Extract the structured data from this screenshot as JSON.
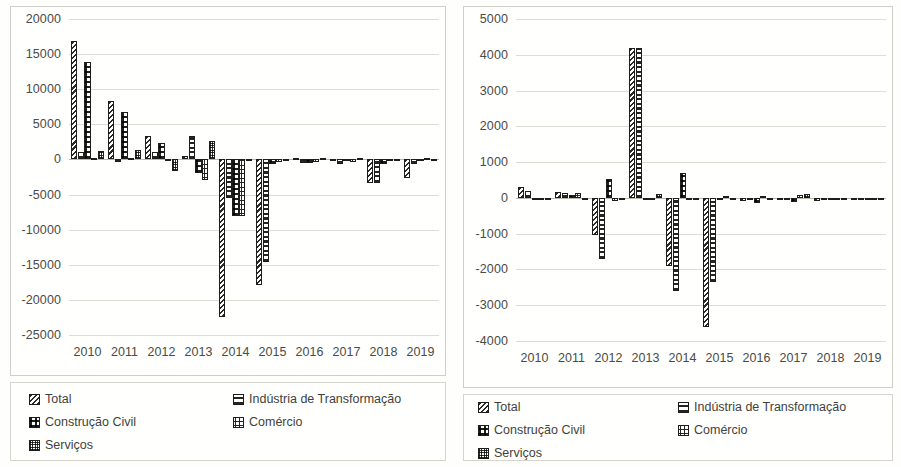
{
  "legend": {
    "entries": [
      {
        "label": "Total",
        "pattern": "diagonal-stripes"
      },
      {
        "label": "Indústria de Transformação",
        "pattern": "horizontal-bands"
      },
      {
        "label": "Construção Civil",
        "pattern": "half-fill-checker"
      },
      {
        "label": "Comércio",
        "pattern": "boxed-outline"
      },
      {
        "label": "Serviços",
        "pattern": "fine-dot-grid"
      }
    ]
  },
  "chart_data": [
    {
      "id": "left",
      "type": "bar",
      "title": "",
      "xlabel": "",
      "ylabel": "",
      "grid": true,
      "legend_position": "bottom",
      "ylim": [
        -25000,
        20000
      ],
      "ytick_step": 5000,
      "yticks": [
        20000,
        15000,
        10000,
        5000,
        0,
        -5000,
        -10000,
        -15000,
        -20000,
        -25000
      ],
      "ytick_labels": [
        "20000",
        "15000",
        "10000",
        "5000",
        "0",
        "-5000",
        "-10000",
        "-15000",
        "-20000",
        "-25000"
      ],
      "categories": [
        "2010",
        "2011",
        "2012",
        "2013",
        "2014",
        "2015",
        "2016",
        "2017",
        "2018",
        "2019"
      ],
      "series": [
        {
          "name": "Total",
          "values": [
            16800,
            8300,
            3400,
            500,
            -22500,
            -17900,
            150,
            -150,
            -3300,
            -2600
          ]
        },
        {
          "name": "Indústria de Transformação",
          "values": [
            1100,
            -300,
            1100,
            3350,
            -5500,
            -14600,
            -500,
            -700,
            -3400,
            -600
          ]
        },
        {
          "name": "Construção Civil",
          "values": [
            13900,
            6800,
            2400,
            -1900,
            -8100,
            -650,
            -550,
            -250,
            -600,
            -250
          ]
        },
        {
          "name": "Comércio",
          "values": [
            200,
            150,
            -100,
            -2900,
            -8050,
            -400,
            -350,
            -400,
            -200,
            150
          ]
        },
        {
          "name": "Serviços",
          "values": [
            1250,
            1400,
            -1700,
            2650,
            -200,
            -250,
            250,
            200,
            -150,
            100
          ]
        }
      ]
    },
    {
      "id": "right",
      "type": "bar",
      "title": "",
      "xlabel": "",
      "ylabel": "",
      "grid": true,
      "legend_position": "bottom",
      "ylim": [
        -4000,
        5000
      ],
      "ytick_step": 1000,
      "yticks": [
        5000,
        4000,
        3000,
        2000,
        1000,
        0,
        -1000,
        -2000,
        -3000,
        -4000
      ],
      "ytick_labels": [
        "5000",
        "4000",
        "3000",
        "2000",
        "1000",
        "0",
        "-1000",
        "-2000",
        "-3000",
        "-4000"
      ],
      "categories": [
        "2010",
        "2011",
        "2012",
        "2013",
        "2014",
        "2015",
        "2016",
        "2017",
        "2018",
        "2019"
      ],
      "series": [
        {
          "name": "Total",
          "values": [
            300,
            160,
            -1050,
            4200,
            -1900,
            -3600,
            -100,
            -60,
            -80,
            -70
          ]
        },
        {
          "name": "Indústria de Transformação",
          "values": [
            200,
            130,
            -1700,
            4200,
            -2600,
            -2350,
            -70,
            -50,
            -60,
            -50
          ]
        },
        {
          "name": "Construção Civil",
          "values": [
            -60,
            90,
            520,
            -60,
            700,
            -60,
            -130,
            -120,
            -60,
            -40
          ]
        },
        {
          "name": "Comércio",
          "values": [
            -30,
            150,
            -80,
            -50,
            -50,
            40,
            60,
            70,
            -30,
            -30
          ]
        },
        {
          "name": "Serviços",
          "values": [
            -25,
            -30,
            -40,
            120,
            -60,
            -40,
            -40,
            100,
            -40,
            -25
          ]
        }
      ]
    }
  ]
}
